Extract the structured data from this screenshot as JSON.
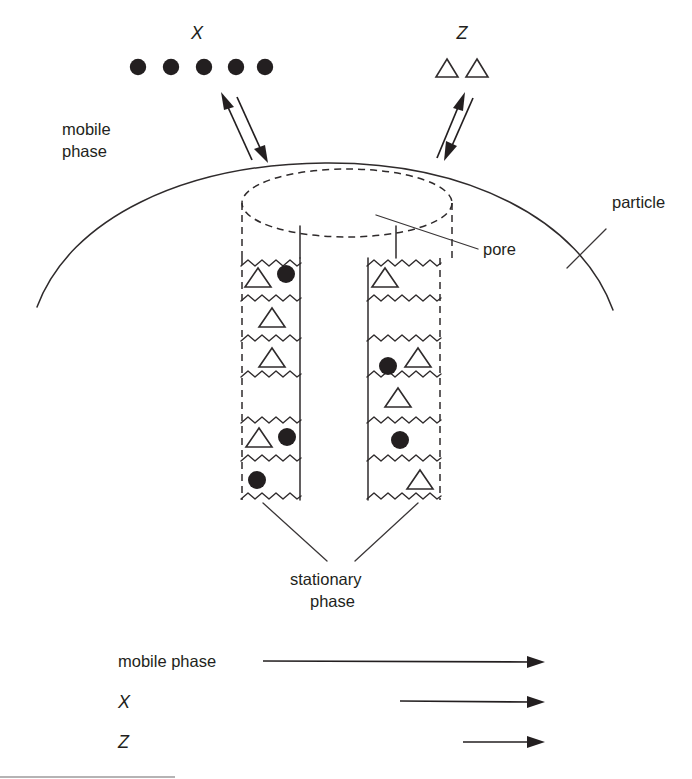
{
  "figure": {
    "type": "scientific-diagram",
    "background_color": "#ffffff",
    "ink_color": "#231f20"
  },
  "top_species": {
    "solute_x": {
      "label": "X",
      "symbol": "filled-circle",
      "count": 5,
      "description": "five filled circles in a horizontal row"
    },
    "solute_z": {
      "label": "Z",
      "symbol": "open-triangle",
      "count": 2,
      "description": "two hollow triangles in a horizontal row"
    }
  },
  "labels": {
    "mobile_phase_line1": "mobile",
    "mobile_phase_line2": "phase",
    "particle": "particle",
    "pore": "pore",
    "stationary_phase_line1": "stationary",
    "stationary_phase_line2": "phase"
  },
  "equilibrium_arrows": {
    "left": {
      "name": "x-exchange-equilibrium",
      "direction": "double-headed, tilted up-left / down-right"
    },
    "right": {
      "name": "z-exchange-equilibrium",
      "direction": "double-headed, tilted up-right / down-left"
    }
  },
  "pore_channels": [
    {
      "name": "left-channel",
      "compartments": [
        {
          "index": 1,
          "contents": [
            "open-triangle",
            "filled-circle"
          ]
        },
        {
          "index": 2,
          "contents": [
            "open-triangle"
          ]
        },
        {
          "index": 3,
          "contents": [
            "open-triangle"
          ]
        },
        {
          "index": 4,
          "contents": [
            "open-triangle",
            "filled-circle"
          ]
        },
        {
          "index": 5,
          "contents": [
            "filled-circle"
          ]
        }
      ]
    },
    {
      "name": "right-channel",
      "compartments": [
        {
          "index": 1,
          "contents": [
            "open-triangle"
          ]
        },
        {
          "index": 2,
          "contents": [
            "filled-circle",
            "open-triangle"
          ]
        },
        {
          "index": 3,
          "contents": [
            "open-triangle"
          ]
        },
        {
          "index": 4,
          "contents": [
            "filled-circle"
          ]
        },
        {
          "index": 5,
          "contents": [
            "open-triangle"
          ]
        }
      ]
    }
  ],
  "velocity_legend": {
    "rows": [
      {
        "label": "mobile phase",
        "arrow_relative_length": 1.0
      },
      {
        "label": "X",
        "arrow_relative_length": 0.58
      },
      {
        "label": "Z",
        "arrow_relative_length": 0.28
      }
    ]
  }
}
